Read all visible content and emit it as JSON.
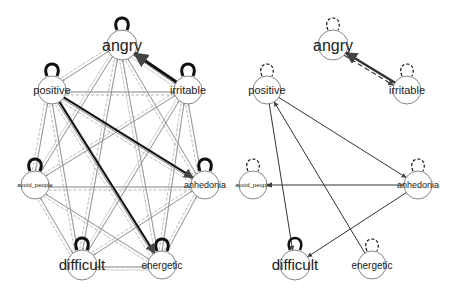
{
  "panels": [
    {
      "id": "left",
      "title": "full network",
      "nodes": [
        {
          "id": "angry",
          "label": "angry",
          "x": 122,
          "y": 45,
          "r": 15,
          "font": 16,
          "loop": "solid"
        },
        {
          "id": "positive",
          "label": "positive",
          "x": 52,
          "y": 90,
          "r": 14,
          "font": 11,
          "loop": "solid"
        },
        {
          "id": "irritable",
          "label": "irritable",
          "x": 188,
          "y": 90,
          "r": 14,
          "font": 11,
          "loop": "solid"
        },
        {
          "id": "avoid_people",
          "label": "avoid_people",
          "x": 35,
          "y": 185,
          "r": 14,
          "font": 6,
          "loop": "solid"
        },
        {
          "id": "anhedonia",
          "label": "anhedonia",
          "x": 205,
          "y": 185,
          "r": 14,
          "font": 9,
          "loop": "solid"
        },
        {
          "id": "difficult",
          "label": "difficult",
          "x": 82,
          "y": 265,
          "r": 15,
          "font": 15,
          "loop": "solid"
        },
        {
          "id": "energetic",
          "label": "energetic",
          "x": 162,
          "y": 265,
          "r": 14,
          "font": 10,
          "loop": "solid"
        }
      ],
      "dense": true,
      "highlight_edges": [
        {
          "from": "irritable",
          "to": "angry",
          "style": "solid",
          "width": 3
        },
        {
          "from": "positive",
          "to": "energetic",
          "style": "solid",
          "width": 2
        },
        {
          "from": "positive",
          "to": "anhedonia",
          "style": "solid",
          "width": 2
        }
      ]
    },
    {
      "id": "right",
      "title": "sparse network",
      "nodes": [
        {
          "id": "angry",
          "label": "angry",
          "x": 333,
          "y": 45,
          "r": 15,
          "font": 16,
          "loop": "dashed"
        },
        {
          "id": "positive",
          "label": "positive",
          "x": 267,
          "y": 90,
          "r": 14,
          "font": 11,
          "loop": "dashed"
        },
        {
          "id": "irritable",
          "label": "irritable",
          "x": 407,
          "y": 90,
          "r": 14,
          "font": 11,
          "loop": "dashed"
        },
        {
          "id": "avoid_people",
          "label": "avoid_people",
          "x": 253,
          "y": 185,
          "r": 14,
          "font": 6,
          "loop": "dashed"
        },
        {
          "id": "anhedonia",
          "label": "anhedonia",
          "x": 418,
          "y": 185,
          "r": 14,
          "font": 9,
          "loop": "dashed"
        },
        {
          "id": "difficult",
          "label": "difficult",
          "x": 295,
          "y": 265,
          "r": 15,
          "font": 15,
          "loop": "solid"
        },
        {
          "id": "energetic",
          "label": "energetic",
          "x": 372,
          "y": 265,
          "r": 14,
          "font": 10,
          "loop": "dashed"
        }
      ],
      "edges": [
        {
          "from": "irritable",
          "to": "angry",
          "style": "solid",
          "width": 2.5
        },
        {
          "from": "angry",
          "to": "irritable",
          "style": "dashed",
          "width": 1.2
        },
        {
          "from": "positive",
          "to": "difficult",
          "style": "solid",
          "width": 1
        },
        {
          "from": "energetic",
          "to": "positive",
          "style": "solid",
          "width": 1
        },
        {
          "from": "positive",
          "to": "anhedonia",
          "style": "solid",
          "width": 1
        },
        {
          "from": "anhedonia",
          "to": "avoid_people",
          "style": "solid",
          "width": 1.2
        },
        {
          "from": "anhedonia",
          "to": "difficult",
          "style": "solid",
          "width": 1
        }
      ]
    }
  ]
}
